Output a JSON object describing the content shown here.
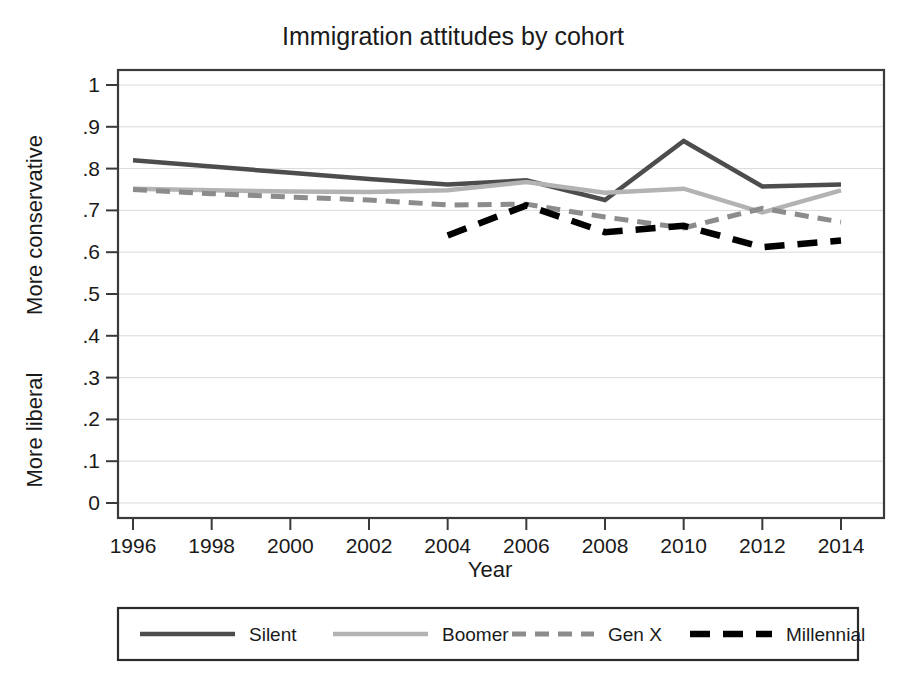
{
  "chart_data": {
    "type": "line",
    "title": "Immigration attitudes by cohort",
    "xlabel": "Year",
    "ylabel_top": "More conservative",
    "ylabel_bottom": "More liberal",
    "xlim": [
      1995,
      2015
    ],
    "ylim": [
      0,
      1
    ],
    "xticks": [
      1996,
      1998,
      2000,
      2002,
      2004,
      2006,
      2008,
      2010,
      2012,
      2014
    ],
    "xtick_labels": [
      "1996",
      "1998",
      "2000",
      "2002",
      "2004",
      "2006",
      "2008",
      "2010",
      "2012",
      "2014"
    ],
    "yticks": [
      0,
      0.1,
      0.2,
      0.3,
      0.4,
      0.5,
      0.6,
      0.7,
      0.8,
      0.9,
      1
    ],
    "ytick_labels": [
      "0",
      ".1",
      ".2",
      ".3",
      ".4",
      ".5",
      ".6",
      ".7",
      ".8",
      ".9",
      "1"
    ],
    "grid": true,
    "grid_axis": "y",
    "legend_position": "below",
    "series": [
      {
        "name": "Silent",
        "color": "#4d4d4d",
        "width": 4.5,
        "dash": "none",
        "x": [
          1996,
          1998,
          2000,
          2002,
          2004,
          2006,
          2008,
          2010,
          2012,
          2014
        ],
        "y": [
          0.82,
          0.805,
          0.79,
          0.775,
          0.762,
          0.772,
          0.725,
          0.866,
          0.757,
          0.762
        ]
      },
      {
        "name": "Boomer",
        "color": "#b3b3b3",
        "width": 4.5,
        "dash": "none",
        "x": [
          1996,
          1998,
          2000,
          2002,
          2004,
          2006,
          2008,
          2010,
          2012,
          2014
        ],
        "y": [
          0.752,
          0.748,
          0.745,
          0.744,
          0.748,
          0.768,
          0.742,
          0.752,
          0.695,
          0.748
        ]
      },
      {
        "name": "Gen X",
        "color": "#8c8c8c",
        "width": 5,
        "dash": "14,9",
        "x": [
          1996,
          1998,
          2000,
          2002,
          2004,
          2006,
          2008,
          2010,
          2012,
          2014
        ],
        "y": [
          0.75,
          0.74,
          0.732,
          0.725,
          0.713,
          0.715,
          0.684,
          0.658,
          0.705,
          0.672
        ]
      },
      {
        "name": "Millennial",
        "color": "#000000",
        "width": 6.5,
        "dash": "20,13",
        "x": [
          2004,
          2006,
          2008,
          2010,
          2012,
          2014
        ],
        "y": [
          0.64,
          0.712,
          0.648,
          0.663,
          0.612,
          0.628
        ]
      }
    ]
  },
  "legend": {
    "items": [
      {
        "label": "Silent"
      },
      {
        "label": "Boomer"
      },
      {
        "label": "Gen X"
      },
      {
        "label": "Millennial"
      }
    ]
  }
}
